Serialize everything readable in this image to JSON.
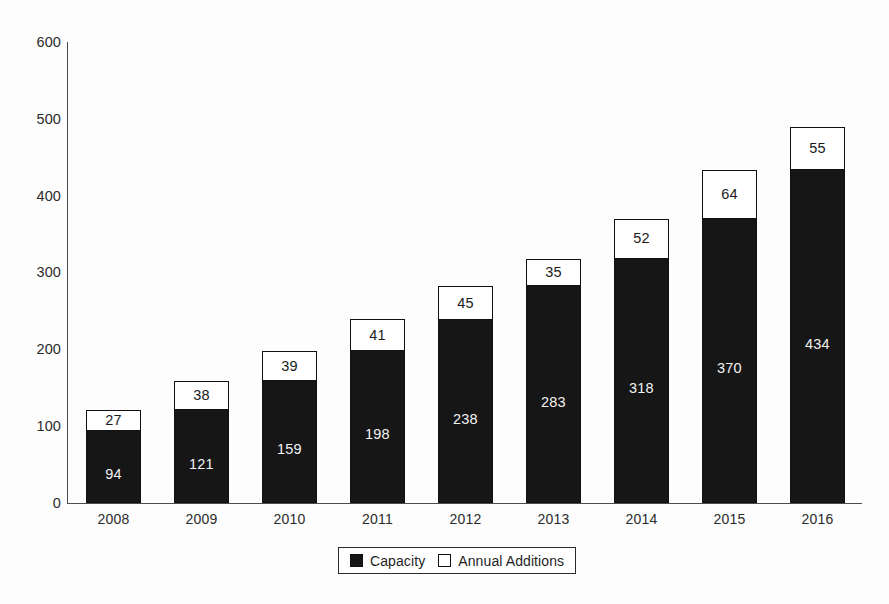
{
  "chart_data": {
    "type": "bar",
    "subtype": "stacked",
    "title": "",
    "subtitle": "",
    "xlabel": "",
    "ylabel": "",
    "categories": [
      "2008",
      "2009",
      "2010",
      "2011",
      "2012",
      "2013",
      "2014",
      "2015",
      "2016"
    ],
    "series": [
      {
        "name": "Capacity",
        "color": "#161616",
        "values": [
          94,
          121,
          159,
          198,
          238,
          283,
          318,
          370,
          434
        ]
      },
      {
        "name": "Annual Additions",
        "color": "#ffffff",
        "values": [
          27,
          38,
          39,
          41,
          45,
          35,
          52,
          64,
          55
        ]
      }
    ],
    "totals": [
      121,
      159,
      198,
      239,
      283,
      318,
      370,
      434,
      489
    ],
    "ylim": [
      0,
      600
    ],
    "y_ticks": [
      0,
      100,
      200,
      300,
      400,
      500,
      600
    ],
    "y_tick_labels": [
      "0",
      "100",
      "200",
      "300",
      "400",
      "500",
      "600"
    ],
    "grid": false,
    "legend_position": "bottom-center"
  },
  "axes": {
    "y_tick_labels": [
      "600",
      "500",
      "400",
      "300",
      "200",
      "100",
      "0"
    ],
    "x_tick_labels": [
      "2008",
      "2009",
      "2010",
      "2011",
      "2012",
      "2013",
      "2014",
      "2015",
      "2016"
    ]
  },
  "bars": [
    {
      "year": "2008",
      "capacity": "94",
      "additions": "27"
    },
    {
      "year": "2009",
      "capacity": "121",
      "additions": "38"
    },
    {
      "year": "2010",
      "capacity": "159",
      "additions": "39"
    },
    {
      "year": "2011",
      "capacity": "198",
      "additions": "41"
    },
    {
      "year": "2012",
      "capacity": "238",
      "additions": "45"
    },
    {
      "year": "2013",
      "capacity": "283",
      "additions": "35"
    },
    {
      "year": "2014",
      "capacity": "318",
      "additions": "52"
    },
    {
      "year": "2015",
      "capacity": "370",
      "additions": "64"
    },
    {
      "year": "2016",
      "capacity": "434",
      "additions": "55"
    }
  ],
  "legend": {
    "items": [
      {
        "label": "Capacity",
        "swatch": "filled-black-square"
      },
      {
        "label": "Annual Additions",
        "swatch": "outlined-white-square"
      }
    ]
  },
  "colors": {
    "capacity_fill": "#161616",
    "additions_fill": "#ffffff",
    "outline": "#111111",
    "axis": "#4d4d4d",
    "background": "#fdfdfd",
    "text": "#1f1f1f"
  }
}
